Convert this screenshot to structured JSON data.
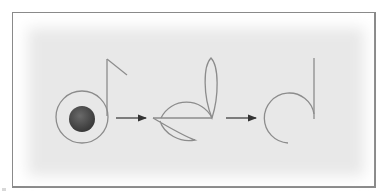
{
  "diagram": {
    "title": "",
    "colors": {
      "frame": "#8a8a8a",
      "background_outer": "#ffffff",
      "background_inner": "#e9e9e9",
      "stroke": "#8c8c8c",
      "note_head_fill": "#4a4a4a",
      "arrow": "#333333"
    },
    "stages": [
      {
        "id": "stage-1",
        "label": "",
        "shape": "eighth-note with ring"
      },
      {
        "id": "stage-2",
        "label": "",
        "shape": "exploded primitives"
      },
      {
        "id": "stage-3",
        "label": "",
        "shape": "arc with stem"
      }
    ],
    "arrows": [
      {
        "from": "stage-1",
        "to": "stage-2"
      },
      {
        "from": "stage-2",
        "to": "stage-3"
      }
    ]
  }
}
